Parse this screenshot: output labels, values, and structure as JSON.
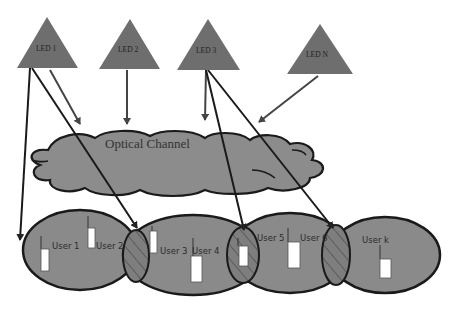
{
  "diagram": {
    "leds": [
      {
        "id": "led-1",
        "label": "LED 1"
      },
      {
        "id": "led-2",
        "label": "LED 2"
      },
      {
        "id": "led-3",
        "label": "LED 3"
      },
      {
        "id": "led-n",
        "label": "LED N"
      }
    ],
    "channel": {
      "label": "Optical Channel"
    },
    "users": [
      {
        "label": "User 1"
      },
      {
        "label": "User 2"
      },
      {
        "label": "User 3"
      },
      {
        "label": "User 4"
      },
      {
        "label": "User 5"
      },
      {
        "label": "User 6"
      },
      {
        "label": "User k"
      }
    ],
    "colors": {
      "led_fill": "#6e6e6e",
      "cloud_fill": "#8c8c8c",
      "cell_fill": "#8a8a8a",
      "stroke": "#1a1a1a",
      "arrow": "#3a3a3a",
      "device_fill": "#ffffff"
    }
  }
}
